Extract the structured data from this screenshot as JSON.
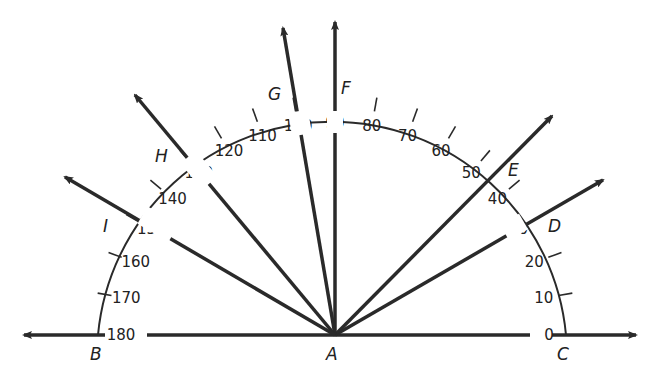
{
  "colors": {
    "ink": "#2a2a2a",
    "background": "#ffffff"
  },
  "center": {
    "label": "A"
  },
  "baseline": {
    "left_label": "B",
    "right_label": "C"
  },
  "scale": {
    "ticks": [
      "0",
      "10",
      "20",
      "30",
      "40",
      "50",
      "60",
      "70",
      "80",
      "90",
      "100",
      "110",
      "120",
      "130",
      "140",
      "150",
      "160",
      "170",
      "180"
    ]
  },
  "rays": [
    {
      "label": "C",
      "angle": 0
    },
    {
      "label": "D",
      "angle": 30
    },
    {
      "label": "E",
      "angle": 45
    },
    {
      "label": "F",
      "angle": 90
    },
    {
      "label": "G",
      "angle": 100
    },
    {
      "label": "H",
      "angle": 130
    },
    {
      "label": "I",
      "angle": 150
    },
    {
      "label": "B",
      "angle": 180
    }
  ],
  "points": {
    "A": "A",
    "B": "B",
    "C": "C",
    "D": "D",
    "E": "E",
    "F": "F",
    "G": "G",
    "H": "H",
    "I": "I"
  }
}
